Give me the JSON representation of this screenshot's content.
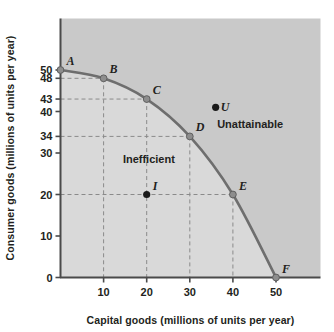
{
  "chart_data": {
    "type": "line",
    "title": "",
    "xlabel": "Capital goods (millions of units per year)",
    "ylabel": "Consumer goods (millions of units per year)",
    "xlim": [
      0,
      60
    ],
    "ylim": [
      0,
      57
    ],
    "xticks": [
      10,
      20,
      30,
      40,
      50
    ],
    "yticks": [
      0,
      10,
      20,
      30,
      34,
      40,
      43,
      48,
      50
    ],
    "grid": false,
    "legend": null,
    "series": [
      {
        "name": "Production possibilities frontier",
        "type": "line",
        "color": "#6e6e6e",
        "x": [
          0,
          10,
          20,
          30,
          40,
          50
        ],
        "values": [
          50,
          48,
          43,
          34,
          20,
          0
        ]
      }
    ],
    "points": [
      {
        "label": "A",
        "x": 0,
        "y": 50,
        "marker": "open-gray",
        "label_pos": "upper-right"
      },
      {
        "label": "B",
        "x": 10,
        "y": 48,
        "marker": "open-gray",
        "label_pos": "upper-right"
      },
      {
        "label": "C",
        "x": 20,
        "y": 43,
        "marker": "open-gray",
        "label_pos": "upper-right"
      },
      {
        "label": "D",
        "x": 30,
        "y": 34,
        "marker": "open-gray",
        "label_pos": "upper-right"
      },
      {
        "label": "E",
        "x": 40,
        "y": 20,
        "marker": "open-gray",
        "label_pos": "upper-right"
      },
      {
        "label": "F",
        "x": 50,
        "y": 0,
        "marker": "open-gray",
        "label_pos": "upper-right"
      },
      {
        "label": "I",
        "x": 20,
        "y": 20,
        "marker": "filled-black",
        "label_pos": "upper-right"
      },
      {
        "label": "U",
        "x": 36,
        "y": 41,
        "marker": "filled-black",
        "label_pos": "right"
      }
    ],
    "annotations": [
      {
        "text": "Unattainable",
        "x": 44,
        "y": 36
      },
      {
        "text": "Inefficient",
        "x": 20.5,
        "y": 27.5
      }
    ],
    "dashed_guides": [
      {
        "from": [
          0,
          48
        ],
        "to": [
          10,
          48
        ]
      },
      {
        "from": [
          10,
          48
        ],
        "to": [
          10,
          0
        ]
      },
      {
        "from": [
          0,
          43
        ],
        "to": [
          20,
          43
        ]
      },
      {
        "from": [
          20,
          43
        ],
        "to": [
          20,
          0
        ]
      },
      {
        "from": [
          0,
          34
        ],
        "to": [
          30,
          34
        ]
      },
      {
        "from": [
          30,
          34
        ],
        "to": [
          30,
          0
        ]
      },
      {
        "from": [
          0,
          20
        ],
        "to": [
          40,
          20
        ]
      },
      {
        "from": [
          40,
          20
        ],
        "to": [
          40,
          0
        ]
      }
    ],
    "regions": {
      "unattainable_fill": "#c9c9c9",
      "inefficient_fill": "#d9d9d9"
    },
    "colors": {
      "curve": "#6e6e6e",
      "axis": "#4a4a4a",
      "dash": "#8a8a8a",
      "text": "#231f20",
      "plot_dark": "#c9c9c9",
      "plot_light": "#d9d9d9",
      "marker_open": "#8d8d8d",
      "marker_filled": "#1a1a1a"
    }
  }
}
